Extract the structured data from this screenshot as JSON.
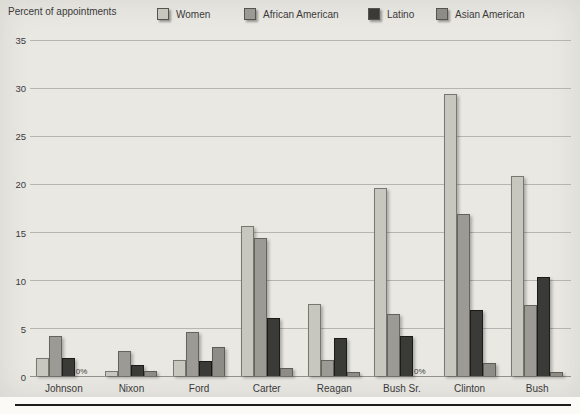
{
  "panel": {
    "y_axis_title": "Percent of appointments",
    "background": "#e9e8e3",
    "gridline_color": "#b6b5b0",
    "bottom_rule_color": "#1d1d1b"
  },
  "legend": {
    "position": "top",
    "items": [
      {
        "label": "Women",
        "color": "#c7c6bf"
      },
      {
        "label": "African American",
        "color": "#9b9a94"
      },
      {
        "label": "Latino",
        "color": "#3a3a37"
      },
      {
        "label": "Asian American",
        "color": "#8d8c86"
      }
    ]
  },
  "chart_data": {
    "type": "bar",
    "title": "",
    "xlabel": "",
    "ylabel": "Percent of appointments",
    "ylim": [
      0,
      35
    ],
    "yticks": [
      0,
      5,
      10,
      15,
      20,
      25,
      30,
      35
    ],
    "grid": true,
    "legend_position": "top",
    "categories": [
      "Johnson",
      "Nixon",
      "Ford",
      "Carter",
      "Reagan",
      "Bush Sr.",
      "Clinton",
      "Bush"
    ],
    "series": [
      {
        "name": "Women",
        "color": "#c7c6bf",
        "values": [
          1.9,
          0.5,
          1.7,
          15.6,
          7.5,
          19.5,
          29.3,
          20.8
        ]
      },
      {
        "name": "African American",
        "color": "#9b9a94",
        "values": [
          4.2,
          2.6,
          4.6,
          14.3,
          1.7,
          6.4,
          16.8,
          7.4
        ]
      },
      {
        "name": "Latino",
        "color": "#3a3a37",
        "values": [
          1.9,
          1.1,
          1.6,
          6.0,
          4.0,
          4.2,
          6.9,
          10.3
        ]
      },
      {
        "name": "Asian American",
        "color": "#8d8c86",
        "values": [
          0,
          0.5,
          3.0,
          0.8,
          0.4,
          0,
          1.3,
          0.4
        ]
      }
    ],
    "zero_annotations": [
      {
        "category": "Johnson",
        "series": "Asian American",
        "text": "0%"
      },
      {
        "category": "Bush Sr.",
        "series": "Asian American",
        "text": "0%"
      }
    ]
  }
}
